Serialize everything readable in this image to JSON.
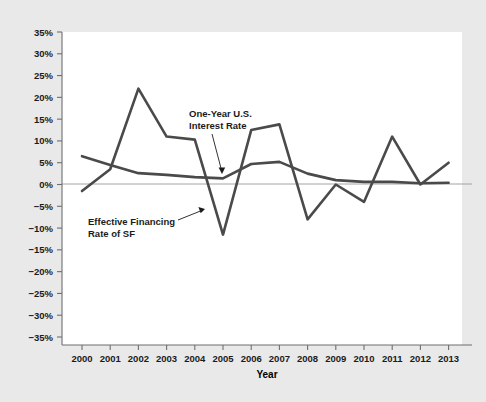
{
  "chart_data": {
    "type": "line",
    "title": "",
    "xlabel": "Year",
    "ylabel": "",
    "x": [
      2000,
      2001,
      2002,
      2003,
      2004,
      2005,
      2006,
      2007,
      2008,
      2009,
      2010,
      2011,
      2012,
      2013
    ],
    "categories": [
      "2000",
      "2001",
      "2002",
      "2003",
      "2004",
      "2005",
      "2006",
      "2007",
      "2008",
      "2009",
      "2010",
      "2011",
      "2012",
      "2013"
    ],
    "ylim": [
      -35,
      35
    ],
    "xlim": [
      2000,
      2013
    ],
    "ytick_labels": [
      "35%",
      "30%",
      "25%",
      "20%",
      "15%",
      "10%",
      "5%",
      "0%",
      "−5%",
      "−10%",
      "−15%",
      "−20%",
      "−25%",
      "−30%",
      "−35%"
    ],
    "ytick_values": [
      35,
      30,
      25,
      20,
      15,
      10,
      5,
      0,
      -5,
      -10,
      -15,
      -20,
      -25,
      -30,
      -35
    ],
    "grid": false,
    "legend_position": "inline-annotations",
    "series": [
      {
        "name": "Effective Financing Rate of SF",
        "color": "#4a4a4a",
        "width": 2.6,
        "values": [
          -1.5,
          3.5,
          22.0,
          11.0,
          10.3,
          -11.5,
          12.5,
          13.8,
          -8.0,
          0.0,
          -4.0,
          11.0,
          0.0,
          5.0
        ]
      },
      {
        "name": "One-Year U.S. Interest Rate",
        "color": "#4a4a4a",
        "width": 2.6,
        "values": [
          6.5,
          4.5,
          2.6,
          2.2,
          1.7,
          1.4,
          4.7,
          5.2,
          2.5,
          1.0,
          0.6,
          0.6,
          0.3,
          0.4
        ]
      }
    ],
    "annotations": [
      {
        "name": "one-year-us-interest-rate",
        "text_line1": "One-Year U.S.",
        "text_line2": "Interest Rate"
      },
      {
        "name": "effective-financing-rate-of-sf",
        "text_line1": "Effective Financing",
        "text_line2": "Rate of SF"
      }
    ]
  },
  "axes": {
    "x_title": "Year"
  },
  "colors": {
    "page_background": "#e9e9e9",
    "plot_background": "#ffffff",
    "line": "#4a4a4a",
    "axis": "#6f6f6f",
    "zero_line": "#9a9a9a",
    "text": "#1b1b1b"
  }
}
